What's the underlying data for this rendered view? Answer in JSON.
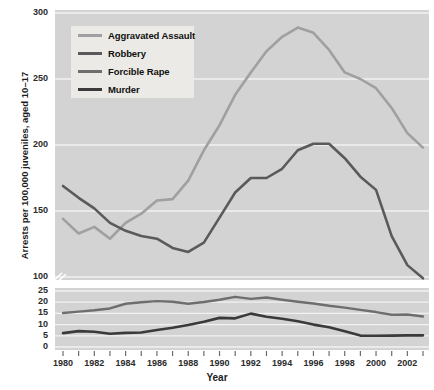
{
  "chart_data": {
    "type": "line",
    "title": "",
    "xlabel": "Year",
    "ylabel": "Arrests per 100,000 juveniles, aged 10–17",
    "grid": true,
    "legend_position": "upper-left",
    "note": "Broken y-axis: upper panel 100-300, lower panel 0-25",
    "x": [
      1980,
      1981,
      1982,
      1983,
      1984,
      1985,
      1986,
      1987,
      1988,
      1989,
      1990,
      1991,
      1992,
      1993,
      1994,
      1995,
      1996,
      1997,
      1998,
      1999,
      2000,
      2001,
      2002,
      2003
    ],
    "xtick_labels": [
      "1980",
      "1982",
      "1984",
      "1986",
      "1988",
      "1990",
      "1992",
      "1994",
      "1996",
      "1998",
      "2000",
      "2002"
    ],
    "upper_panel": {
      "ylim": [
        100,
        300
      ],
      "yticks": [
        100,
        150,
        200,
        250,
        300
      ],
      "ytick_labels": [
        "100",
        "150",
        "200",
        "250",
        "300"
      ]
    },
    "lower_panel": {
      "ylim": [
        0,
        25
      ],
      "yticks": [
        0,
        5,
        10,
        15,
        20,
        25
      ],
      "ytick_labels": [
        "0",
        "5",
        "10",
        "15",
        "20",
        "25"
      ]
    },
    "series": [
      {
        "name": "Aggravated Assault",
        "panel": "upper",
        "color": "#a0a0a0",
        "width": 2.6,
        "values": [
          144,
          133,
          138,
          129,
          141,
          148,
          158,
          159,
          173,
          196,
          215,
          238,
          255,
          271,
          282,
          289,
          285,
          272,
          255,
          250,
          243,
          228,
          209,
          198
        ]
      },
      {
        "name": "Robbery",
        "panel": "upper",
        "color": "#5a5a5a",
        "width": 2.6,
        "values": [
          169,
          160,
          152,
          141,
          135,
          131,
          129,
          122,
          119,
          126,
          145,
          164,
          175,
          175,
          182,
          196,
          201,
          201,
          190,
          176,
          166,
          131,
          109,
          99
        ]
      },
      {
        "name": "Forcible Rape",
        "panel": "lower",
        "color": "#6e6e6e",
        "width": 2.4,
        "values": [
          15.2,
          15.8,
          16.4,
          17.2,
          19.3,
          20.0,
          20.5,
          20.2,
          19.3,
          20.1,
          21.1,
          22.4,
          21.5,
          22.1,
          21.1,
          20.2,
          19.4,
          18.4,
          17.6,
          16.6,
          15.6,
          14.4,
          14.5,
          13.6
        ]
      },
      {
        "name": "Murder",
        "panel": "lower",
        "color": "#3a3a3a",
        "width": 2.6,
        "values": [
          6.2,
          7.1,
          6.8,
          5.9,
          6.3,
          6.5,
          7.6,
          8.6,
          9.8,
          11.3,
          13.0,
          12.8,
          14.9,
          13.5,
          12.6,
          11.5,
          10.0,
          8.8,
          7.0,
          5.1,
          5.0,
          5.1,
          5.2,
          5.2
        ]
      }
    ]
  },
  "legend": {
    "items": [
      {
        "label": "Aggravated Assault",
        "color": "#a0a0a0",
        "thickness": 3
      },
      {
        "label": "Robbery",
        "color": "#5a5a5a",
        "thickness": 3
      },
      {
        "label": "Forcible Rape",
        "color": "#6e6e6e",
        "thickness": 3
      },
      {
        "label": "Murder",
        "color": "#3a3a3a",
        "thickness": 3
      }
    ]
  },
  "colors": {
    "plot_background": "#d3d3d3",
    "page_background": "#ffffff",
    "gridline": "#f2f2f2",
    "axis_text": "#2b2b2b",
    "legend_background": "#eceae6"
  }
}
